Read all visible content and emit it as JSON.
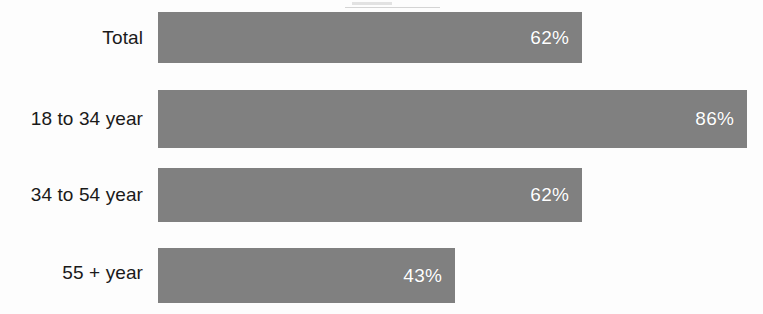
{
  "chart_data": {
    "type": "bar",
    "orientation": "horizontal",
    "title": "",
    "subtitle": "",
    "xlabel": "",
    "ylabel": "",
    "categories": [
      "Total",
      "18 to 34 year",
      "34 to 54 year",
      "55 + year"
    ],
    "values": [
      62,
      86,
      62,
      43
    ],
    "value_labels": [
      "62%",
      "86%",
      "62%",
      "43%"
    ],
    "units": "percent",
    "xlim": [
      0,
      86
    ],
    "grid": false,
    "legend": null,
    "axis_ticks_visible": false,
    "bar_color": "#808080",
    "value_label_color": "#ffffff",
    "category_label_color": "#1a1a1a",
    "background_color": "#fdfdfd"
  },
  "rows": [
    {
      "label": "Total",
      "value_label": "62%",
      "value": 62,
      "bar_width_px": 424,
      "top_px": 12,
      "height_px": 51,
      "label_top_px": 27
    },
    {
      "label": "18 to 34 year",
      "value_label": "86%",
      "value": 86,
      "bar_width_px": 589,
      "top_px": 90,
      "height_px": 58,
      "label_top_px": 108
    },
    {
      "label": "34 to 54 year",
      "value_label": "62%",
      "value": 62,
      "bar_width_px": 424,
      "top_px": 168,
      "height_px": 54,
      "label_top_px": 184
    },
    {
      "label": "55 + year",
      "value_label": "43%",
      "value": 43,
      "bar_width_px": 297,
      "top_px": 248,
      "height_px": 55,
      "label_top_px": 262
    }
  ]
}
